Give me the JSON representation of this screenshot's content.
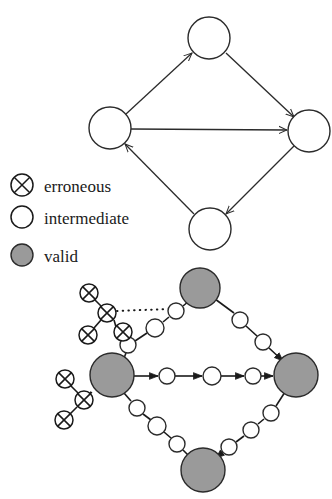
{
  "figure": {
    "title": "",
    "background_color": "#ffffff",
    "stroke_color": "#2b2b2b",
    "valid_fill_color": "#9a9a9a",
    "intermediate_fill_color": "#ffffff",
    "erroneous_fill_color": "#ffffff"
  },
  "legend": {
    "items": [
      {
        "key": "erroneous",
        "label": "erroneous",
        "glyph": "crossed-circle-icon",
        "cx": 22,
        "cy": 185,
        "r": 11
      },
      {
        "key": "intermediate",
        "label": "intermediate",
        "glyph": "empty-circle-icon",
        "cx": 22,
        "cy": 217,
        "r": 11
      },
      {
        "key": "valid",
        "label": "valid",
        "glyph": "filled-circle-icon",
        "cx": 22,
        "cy": 255,
        "r": 11
      }
    ],
    "label_x": 44
  },
  "top_diagram": {
    "name": "abstract-state-graph",
    "node_radius": 21,
    "nodes": [
      {
        "id": "top",
        "type": "intermediate",
        "cx": 209,
        "cy": 38
      },
      {
        "id": "left",
        "type": "intermediate",
        "cx": 110,
        "cy": 128
      },
      {
        "id": "right",
        "type": "intermediate",
        "cx": 309,
        "cy": 131
      },
      {
        "id": "bottom",
        "type": "intermediate",
        "cx": 210,
        "cy": 229
      }
    ],
    "edges": [
      {
        "from": "left",
        "to": "top",
        "style": "solid",
        "arrow": true
      },
      {
        "from": "top",
        "to": "right",
        "style": "solid",
        "arrow": true
      },
      {
        "from": "left",
        "to": "right",
        "style": "solid",
        "arrow": true
      },
      {
        "from": "right",
        "to": "bottom",
        "style": "solid",
        "arrow": true
      },
      {
        "from": "bottom",
        "to": "left",
        "style": "solid",
        "arrow": true
      }
    ]
  },
  "bottom_diagram": {
    "name": "refined-state-graph",
    "valid_radius": 20,
    "intermediate_radius": 8,
    "erroneous_radius": 8,
    "nodes": [
      {
        "id": "v-top",
        "type": "valid",
        "cx": 200,
        "cy": 288,
        "r": 20
      },
      {
        "id": "v-left",
        "type": "valid",
        "cx": 112,
        "cy": 375,
        "r": 22
      },
      {
        "id": "v-right",
        "type": "valid",
        "cx": 296,
        "cy": 375,
        "r": 22
      },
      {
        "id": "v-bottom",
        "type": "valid",
        "cx": 203,
        "cy": 470,
        "r": 22
      },
      {
        "id": "i-ul-1",
        "type": "intermediate",
        "cx": 128,
        "cy": 345,
        "r": 8
      },
      {
        "id": "i-ul-2",
        "type": "intermediate",
        "cx": 155,
        "cy": 328,
        "r": 9
      },
      {
        "id": "i-ul-3",
        "type": "intermediate",
        "cx": 176,
        "cy": 311,
        "r": 8
      },
      {
        "id": "i-mid-1",
        "type": "intermediate",
        "cx": 167,
        "cy": 376,
        "r": 8
      },
      {
        "id": "i-mid-2",
        "type": "intermediate",
        "cx": 212,
        "cy": 376,
        "r": 9
      },
      {
        "id": "i-mid-3",
        "type": "intermediate",
        "cx": 253,
        "cy": 376,
        "r": 8
      },
      {
        "id": "i-ur-1",
        "type": "intermediate",
        "cx": 240,
        "cy": 320,
        "r": 8
      },
      {
        "id": "i-ur-2",
        "type": "intermediate",
        "cx": 263,
        "cy": 342,
        "r": 8
      },
      {
        "id": "i-bl-1",
        "type": "intermediate",
        "cx": 137,
        "cy": 408,
        "r": 8
      },
      {
        "id": "i-bl-2",
        "type": "intermediate",
        "cx": 157,
        "cy": 426,
        "r": 9
      },
      {
        "id": "i-bl-3",
        "type": "intermediate",
        "cx": 177,
        "cy": 444,
        "r": 8
      },
      {
        "id": "i-br-1",
        "type": "intermediate",
        "cx": 271,
        "cy": 413,
        "r": 8
      },
      {
        "id": "i-br-2",
        "type": "intermediate",
        "cx": 251,
        "cy": 430,
        "r": 8
      },
      {
        "id": "i-br-3",
        "type": "intermediate",
        "cx": 229,
        "cy": 447,
        "r": 8
      },
      {
        "id": "e-u-hub",
        "type": "erroneous",
        "cx": 107,
        "cy": 313,
        "r": 9
      },
      {
        "id": "e-u-a",
        "type": "erroneous",
        "cx": 89,
        "cy": 293,
        "r": 9
      },
      {
        "id": "e-u-b",
        "type": "erroneous",
        "cx": 88,
        "cy": 335,
        "r": 9
      },
      {
        "id": "e-u-c",
        "type": "erroneous",
        "cx": 123,
        "cy": 332,
        "r": 9
      },
      {
        "id": "e-l-hub",
        "type": "erroneous",
        "cx": 84,
        "cy": 400,
        "r": 9
      },
      {
        "id": "e-l-a",
        "type": "erroneous",
        "cx": 65,
        "cy": 379,
        "r": 9
      },
      {
        "id": "e-l-b",
        "type": "erroneous",
        "cx": 64,
        "cy": 420,
        "r": 9
      }
    ],
    "edges": [
      {
        "from": "v-left",
        "to": "i-ul-1",
        "style": "solid"
      },
      {
        "from": "i-ul-1",
        "to": "i-ul-2",
        "style": "solid"
      },
      {
        "from": "i-ul-2",
        "to": "i-ul-3",
        "style": "solid"
      },
      {
        "from": "i-ul-3",
        "to": "v-top",
        "style": "solid"
      },
      {
        "from": "v-left",
        "to": "i-mid-1",
        "style": "solid",
        "arrow": true
      },
      {
        "from": "i-mid-1",
        "to": "i-mid-2",
        "style": "solid",
        "arrow": true
      },
      {
        "from": "i-mid-2",
        "to": "i-mid-3",
        "style": "solid",
        "arrow": true
      },
      {
        "from": "i-mid-3",
        "to": "v-right",
        "style": "solid",
        "arrow": true
      },
      {
        "from": "v-top",
        "to": "i-ur-1",
        "style": "solid"
      },
      {
        "from": "i-ur-1",
        "to": "i-ur-2",
        "style": "solid"
      },
      {
        "from": "i-ur-2",
        "to": "v-right",
        "style": "solid",
        "arrow": true
      },
      {
        "from": "v-left",
        "to": "i-bl-1",
        "style": "solid"
      },
      {
        "from": "i-bl-1",
        "to": "i-bl-2",
        "style": "solid"
      },
      {
        "from": "i-bl-2",
        "to": "i-bl-3",
        "style": "solid"
      },
      {
        "from": "i-bl-3",
        "to": "v-bottom",
        "style": "solid"
      },
      {
        "from": "v-right",
        "to": "i-br-1",
        "style": "solid"
      },
      {
        "from": "i-br-1",
        "to": "i-br-2",
        "style": "solid"
      },
      {
        "from": "i-br-2",
        "to": "i-br-3",
        "style": "solid"
      },
      {
        "from": "i-br-3",
        "to": "v-bottom",
        "style": "solid",
        "arrow": true
      },
      {
        "from": "i-ul-1",
        "to": "e-u-c",
        "style": "solid"
      },
      {
        "from": "e-u-c",
        "to": "e-u-hub",
        "style": "solid"
      },
      {
        "from": "e-u-hub",
        "to": "e-u-a",
        "style": "solid"
      },
      {
        "from": "e-u-hub",
        "to": "e-u-b",
        "style": "solid"
      },
      {
        "from": "e-u-hub",
        "to": "i-ul-3",
        "style": "dotted"
      },
      {
        "from": "v-left",
        "to": "e-l-hub",
        "style": "solid"
      },
      {
        "from": "e-l-hub",
        "to": "e-l-a",
        "style": "solid"
      },
      {
        "from": "e-l-hub",
        "to": "e-l-b",
        "style": "solid"
      }
    ]
  }
}
